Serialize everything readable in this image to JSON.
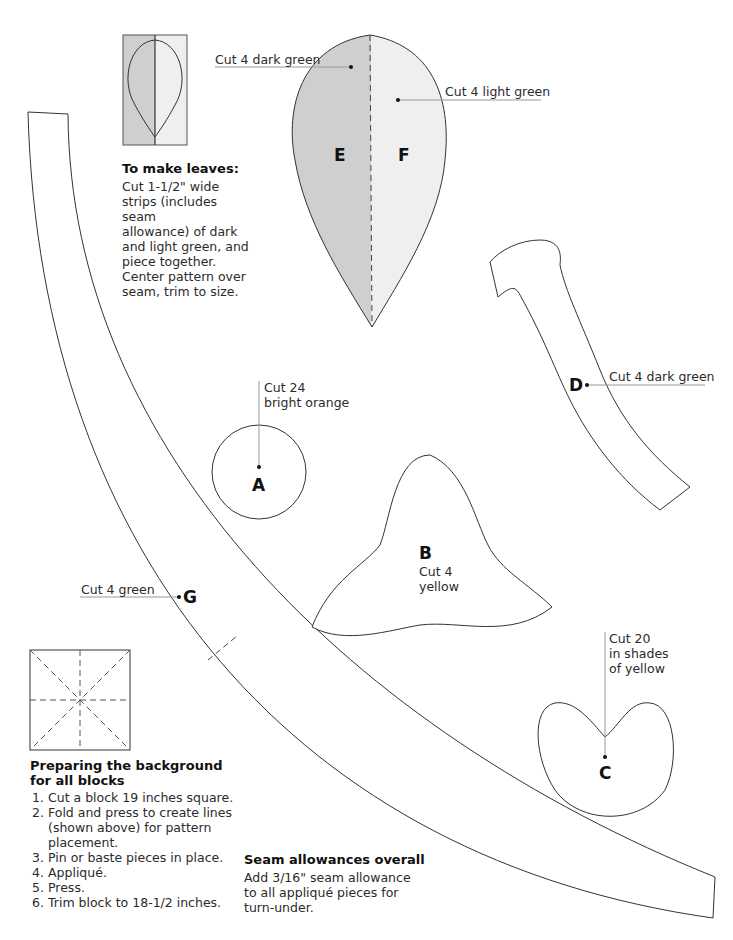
{
  "colors": {
    "dark_green": "#cfcfcf",
    "light_green": "#efefef",
    "outline": "#333333",
    "leader": "#999999"
  },
  "leaves_note": {
    "title": "To make leaves:",
    "lines": [
      "Cut 1-1/2\" wide",
      "strips (includes",
      "seam",
      "allowance) of dark",
      "and light green, and",
      "piece together.",
      "Center pattern over",
      "seam, trim to size."
    ]
  },
  "pieces": {
    "E": {
      "letter": "E",
      "label": "Cut 4 dark green"
    },
    "F": {
      "letter": "F",
      "label": "Cut 4 light green"
    },
    "D": {
      "letter": "D",
      "label": "Cut 4 dark green"
    },
    "A": {
      "letter": "A",
      "label_line1": "Cut 24",
      "label_line2": "bright orange"
    },
    "B": {
      "letter": "B",
      "label_line1": "Cut 4",
      "label_line2": "yellow"
    },
    "C": {
      "letter": "C",
      "label_line1": "Cut 20",
      "label_line2": "in shades",
      "label_line3": "of yellow"
    },
    "G": {
      "letter": "G",
      "label": "Cut 4 green"
    }
  },
  "background_note": {
    "title_line1": "Preparing the background",
    "title_line2": "for all blocks",
    "steps": [
      "Cut a block 19 inches square.",
      "Fold and press to create lines (shown above) for pattern placement.",
      "Pin or baste pieces in place.",
      "Appliqué.",
      "Press.",
      "Trim block to 18-1/2 inches."
    ]
  },
  "seam_note": {
    "title": "Seam allowances overall",
    "lines": [
      "Add 3/16\" seam allowance",
      "to all appliqué pieces for",
      "turn-under."
    ]
  }
}
